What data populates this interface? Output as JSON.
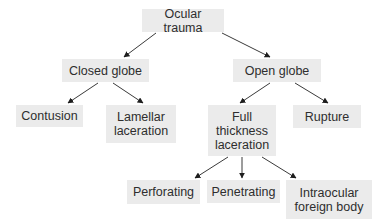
{
  "diagram": {
    "type": "tree",
    "colors": {
      "node_fill": "#ebebeb",
      "text": "#2e2e2e",
      "edge": "#3a3a3a"
    },
    "nodes": {
      "ocular_trauma": {
        "label": "Ocular trauma"
      },
      "closed_globe": {
        "label": "Closed globe"
      },
      "open_globe": {
        "label": "Open globe"
      },
      "contusion": {
        "label": "Contusion"
      },
      "lamellar_laceration": {
        "label": "Lamellar\nlaceration"
      },
      "full_thickness_laceration": {
        "label": "Full\nthickness\nlaceration"
      },
      "rupture": {
        "label": "Rupture"
      },
      "perforating": {
        "label": "Perforating"
      },
      "penetrating": {
        "label": "Penetrating"
      },
      "intraocular_foreign_body": {
        "label": "Intraocular\nforeign body"
      }
    },
    "edges": [
      {
        "from": "ocular_trauma",
        "to": "closed_globe"
      },
      {
        "from": "ocular_trauma",
        "to": "open_globe"
      },
      {
        "from": "closed_globe",
        "to": "contusion"
      },
      {
        "from": "closed_globe",
        "to": "lamellar_laceration"
      },
      {
        "from": "open_globe",
        "to": "full_thickness_laceration"
      },
      {
        "from": "open_globe",
        "to": "rupture"
      },
      {
        "from": "full_thickness_laceration",
        "to": "perforating"
      },
      {
        "from": "full_thickness_laceration",
        "to": "penetrating"
      },
      {
        "from": "full_thickness_laceration",
        "to": "intraocular_foreign_body"
      }
    ]
  }
}
